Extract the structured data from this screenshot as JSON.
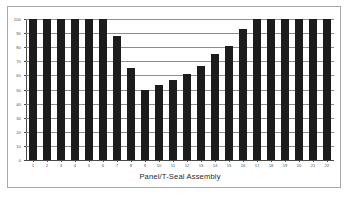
{
  "figure": {
    "background_color": "#ffffff",
    "frame_color": "#a8a8a8",
    "bar_color": "#1c1c1c",
    "gridline_color": "#8c8c8c",
    "axis_color": "#4a4a4a"
  },
  "chart_data": {
    "type": "bar",
    "title": "",
    "xlabel": "Panel/T-Seal Assembly",
    "ylabel": "",
    "ylim": [
      0,
      100
    ],
    "grid": true,
    "legend": "none",
    "y_ticks": [
      0,
      10,
      20,
      30,
      40,
      50,
      60,
      70,
      80,
      90,
      100
    ],
    "y_tick_labels": [
      "0",
      "10",
      "20",
      "30",
      "40",
      "50",
      "60",
      "70",
      "80",
      "90",
      "100"
    ],
    "categories": [
      "1",
      "2",
      "3",
      "4",
      "5",
      "6",
      "7",
      "8",
      "9",
      "10",
      "11",
      "12",
      "13",
      "14",
      "15",
      "16",
      "17",
      "18",
      "19",
      "20",
      "21",
      "22"
    ],
    "values": [
      100,
      100,
      100,
      100,
      100,
      100,
      88,
      65,
      50,
      53,
      57,
      61,
      67,
      75,
      81,
      93,
      100,
      100,
      100,
      100,
      100,
      100
    ]
  }
}
